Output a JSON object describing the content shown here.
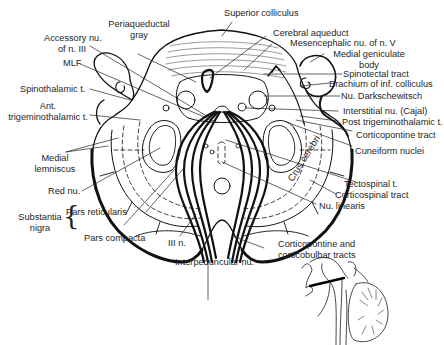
{
  "figure": {
    "type": "anatomical cross-section",
    "labels": {
      "superior_colliculus": "Superior colliculus",
      "periaqueductal_gray": [
        "Periaqueductal",
        "gray"
      ],
      "accessory_nu": [
        "Accessory nu.",
        "of n. III"
      ],
      "cerebral_aqueduct": "Cerebral aqueduct",
      "mesencephalic_nu": "Mesencephalic nu. of n. V",
      "medial_geniculate": [
        "Medial geniculate",
        "body"
      ],
      "mlf": "MLF",
      "spinotectal": "Spinotectal tract",
      "brachium": "Brachium of inf. colliculus",
      "spinothalamic": "Spinothalamic t.",
      "nu_darkschewitsch": "Nu. Darkschewitsch",
      "ant_trigeminothalamic": [
        "Ant.",
        "trigeminothalamic t."
      ],
      "interstitial_nu": "Interstitial nu. (Cajal)",
      "post_trigeminothalamic": "Post trigeminothalamic t.",
      "corticopontine": "Corticopontine tract",
      "medial_lemniscus": [
        "Medial",
        "lemniscus"
      ],
      "cuneiform": "Cuneiform nuclei",
      "crus_cerebri": "Crus cerebri",
      "red_nu": "Red nu.",
      "tectospinal": "Tectospinal t.",
      "corticospinal": "Corticospinal tract",
      "nu_linearis": "Nu. linearis",
      "substantia_nigra": [
        "Substantia",
        "nigra"
      ],
      "pars_reticularis": "Pars reticularis",
      "pars_compacta": "Pars compacta",
      "third_nerve": "III n.",
      "corticopontine_corticobulbar": [
        "Corticopontine and",
        "corticobulbar tracts"
      ],
      "interpeduncular": "Interpeduncular nu."
    },
    "inset": "Sagittal brainstem sketch with section plane line"
  }
}
